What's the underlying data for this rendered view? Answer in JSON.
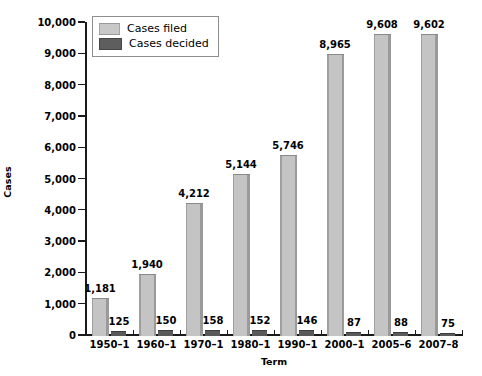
{
  "chart_data": {
    "type": "bar",
    "title": "",
    "xlabel": "Term",
    "ylabel": "Cases",
    "categories": [
      "1950–1",
      "1960–1",
      "1970–1",
      "1980–1",
      "1990–1",
      "2000–1",
      "2005–6",
      "2007–8"
    ],
    "series": [
      {
        "name": "Cases filed",
        "values": [
          1181,
          1940,
          4212,
          5144,
          5746,
          8965,
          9608,
          9602
        ],
        "labels": [
          "1,181",
          "1,940",
          "4,212",
          "5,144",
          "5,746",
          "8,965",
          "9,608",
          "9,602"
        ],
        "color": "#c4c4c4"
      },
      {
        "name": "Cases decided",
        "values": [
          125,
          150,
          158,
          152,
          146,
          87,
          88,
          75
        ],
        "labels": [
          "125",
          "150",
          "158",
          "152",
          "146",
          "87",
          "88",
          "75"
        ],
        "color": "#595959"
      }
    ],
    "ylim": [
      0,
      10000
    ],
    "ytick_values": [
      0,
      1000,
      2000,
      3000,
      4000,
      5000,
      6000,
      7000,
      8000,
      9000,
      10000
    ],
    "ytick_labels": [
      "0",
      "1,000",
      "2,000",
      "3,000",
      "4,000",
      "5,000",
      "6,000",
      "7,000",
      "8,000",
      "9,000",
      "10,000"
    ],
    "grid": false,
    "legend_position": "top-left"
  },
  "legend": {
    "items": [
      {
        "label": "Cases filed",
        "swatch": "legend-swatch-filed"
      },
      {
        "label": "Cases decided",
        "swatch": "legend-swatch-decided"
      }
    ]
  },
  "axes": {
    "y_title": "Cases",
    "x_title": "Term"
  }
}
